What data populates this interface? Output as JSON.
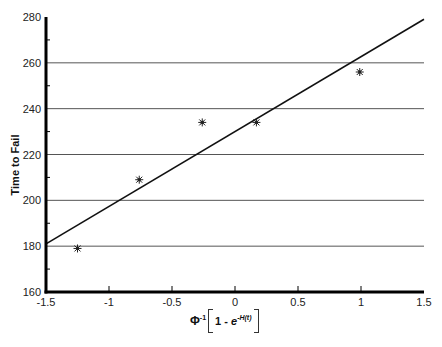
{
  "chart_data": {
    "type": "scatter",
    "title": "",
    "xlabel": "Φ⁻¹[1 - e^(-H(t))]",
    "ylabel": "Time to Fail",
    "xlim": [
      -1.5,
      1.5
    ],
    "ylim": [
      160,
      280
    ],
    "x_ticks": [
      -1.5,
      -1,
      -0.5,
      0,
      0.5,
      1,
      1.5
    ],
    "x_tick_labels": [
      "-1.5",
      "-1",
      "-0.5",
      "0",
      "0.5",
      "1",
      "1.5"
    ],
    "y_ticks": [
      160,
      180,
      200,
      220,
      240,
      260,
      280
    ],
    "y_tick_labels": [
      "160",
      "180",
      "200",
      "220",
      "240",
      "260",
      "280"
    ],
    "grid": {
      "horizontal": true,
      "vertical": false,
      "lines_at": [
        180,
        200,
        220,
        240,
        260
      ]
    },
    "legend": null,
    "series": [
      {
        "name": "Observed",
        "type": "scatter",
        "marker": "asterisk",
        "x": [
          -1.25,
          -0.76,
          -0.26,
          0.17,
          0.99
        ],
        "y": [
          179,
          209,
          234,
          234,
          256
        ]
      },
      {
        "name": "Fitted line",
        "type": "line",
        "x": [
          -1.5,
          1.5
        ],
        "y": [
          181,
          279
        ]
      }
    ]
  },
  "axis_labels": {
    "y": "Time to Fail",
    "x_phi": "Φ",
    "x_phi_sup": "-1",
    "x_inner": "1 - ",
    "x_e": "e",
    "x_e_sup": "-H(t)"
  }
}
